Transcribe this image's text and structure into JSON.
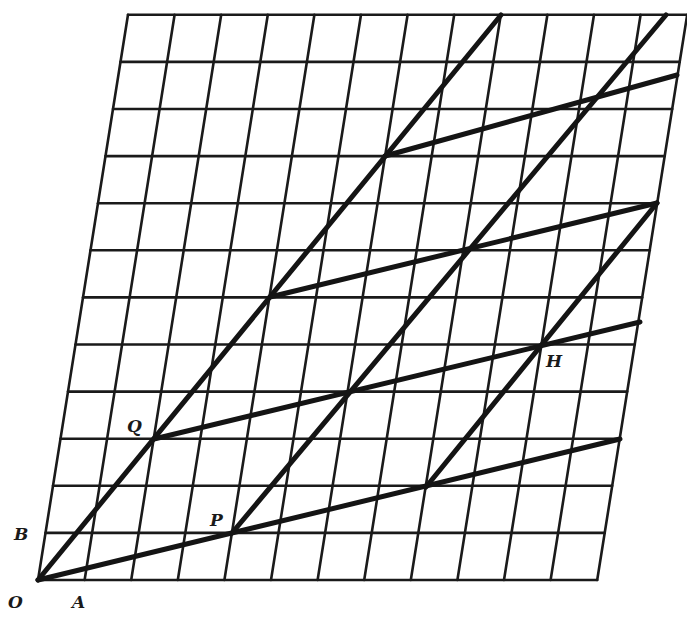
{
  "diagram": {
    "grid": {
      "cols": 12,
      "rows": 12,
      "origin_px": [
        38,
        580
      ],
      "col_step_px": 46.6,
      "row_step_px": 47.1,
      "row_shear_px": 7.5,
      "line_color": "#1a1a1a"
    },
    "thick_lines": [
      {
        "name": "line-OQ",
        "from": [
          38,
          580
        ],
        "to": [
          501,
          15
        ]
      },
      {
        "name": "line-OP",
        "from": [
          38,
          580
        ],
        "to": [
          620,
          439
        ]
      },
      {
        "name": "line-P-diagonal",
        "from": [
          232,
          533
        ],
        "to": [
          666,
          15
        ]
      },
      {
        "name": "line-lower-diagonal",
        "from": [
          426,
          487
        ],
        "to": [
          657,
          203
        ]
      },
      {
        "name": "line-Q-parallel",
        "from": [
          154,
          439
        ],
        "to": [
          640,
          322
        ]
      },
      {
        "name": "line-middle-parallel",
        "from": [
          270,
          297
        ],
        "to": [
          657,
          203
        ]
      },
      {
        "name": "line-top-parallel",
        "from": [
          385,
          156
        ],
        "to": [
          677,
          75
        ]
      }
    ],
    "thick_color": "#141414",
    "labels": [
      {
        "text": "O",
        "x": 8,
        "y": 592
      },
      {
        "text": "A",
        "x": 72,
        "y": 592
      },
      {
        "text": "B",
        "x": 14,
        "y": 524
      },
      {
        "text": "P",
        "x": 210,
        "y": 510
      },
      {
        "text": "Q",
        "x": 127,
        "y": 416
      },
      {
        "text": "H",
        "x": 546,
        "y": 351
      }
    ]
  }
}
